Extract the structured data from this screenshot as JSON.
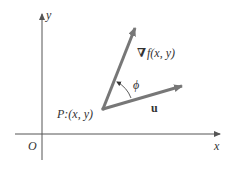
{
  "diagram": {
    "axes": {
      "x_label": "x",
      "y_label": "y",
      "origin_label": "O",
      "color": "#555555"
    },
    "point": {
      "label": "P:(x, y)"
    },
    "vectors": {
      "gradient": {
        "symbol": "∇",
        "label": "f(x, y)",
        "color": "#777777"
      },
      "u": {
        "label": "u",
        "color": "#777777"
      }
    },
    "angle": {
      "label": "ϕ"
    }
  }
}
